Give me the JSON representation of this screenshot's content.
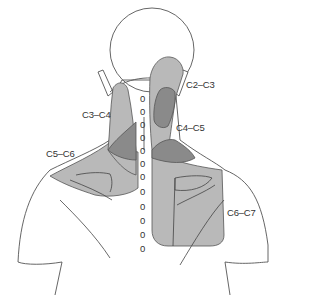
{
  "diagram": {
    "labels": [
      {
        "id": "c2-c3",
        "text": "C2–C3"
      },
      {
        "id": "c3-c4",
        "text": "C3–C4"
      },
      {
        "id": "c4-c5",
        "text": "C4–C5"
      },
      {
        "id": "c5-c6",
        "text": "C5–C6"
      },
      {
        "id": "c6-c7",
        "text": "C6–C7"
      }
    ],
    "colors": {
      "outline": "#444444",
      "light_zone": "#b9b9b9",
      "dark_zone": "#8a8a8a",
      "background": "#ffffff"
    },
    "spine_marker_glyph": "0"
  }
}
